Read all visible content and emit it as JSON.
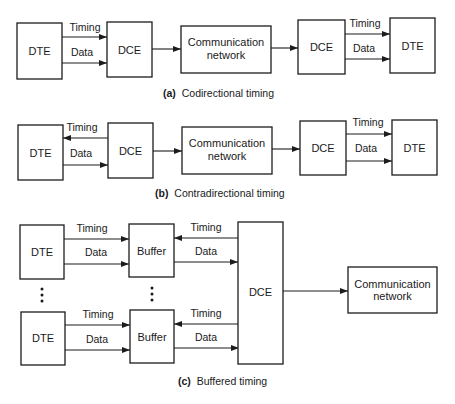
{
  "diagram": {
    "sections": [
      {
        "id": "a",
        "caption_prefix": "(a)",
        "caption_text": "Codirectional timing",
        "nodes": {
          "dte_left": "DTE",
          "dce_left": "DCE",
          "network_line1": "Communication",
          "network_line2": "network",
          "dce_right": "DCE",
          "dte_right": "DTE"
        },
        "signals": {
          "left_timing": "Timing",
          "left_data": "Data",
          "right_timing": "Timing",
          "right_data": "Data"
        },
        "flows": [
          {
            "from": "DTE",
            "to": "DCE",
            "signal": "Timing"
          },
          {
            "from": "DTE",
            "to": "DCE",
            "signal": "Data"
          },
          {
            "from": "DCE",
            "to": "Communication network"
          },
          {
            "from": "Communication network",
            "to": "DCE"
          },
          {
            "from": "DCE",
            "to": "DTE",
            "signal": "Timing"
          },
          {
            "from": "DCE",
            "to": "DTE",
            "signal": "Data"
          }
        ]
      },
      {
        "id": "b",
        "caption_prefix": "(b)",
        "caption_text": "Contradirectional timing",
        "nodes": {
          "dte_left": "DTE",
          "dce_left": "DCE",
          "network_line1": "Communication",
          "network_line2": "network",
          "dce_right": "DCE",
          "dte_right": "DTE"
        },
        "signals": {
          "left_timing": "Timing",
          "left_data": "Data",
          "right_timing": "Timing",
          "right_data": "Data"
        },
        "flows": [
          {
            "from": "DCE",
            "to": "DTE",
            "signal": "Timing"
          },
          {
            "from": "DTE",
            "to": "DCE",
            "signal": "Data"
          },
          {
            "from": "DCE",
            "to": "Communication network"
          },
          {
            "from": "Communication network",
            "to": "DCE"
          },
          {
            "from": "DCE",
            "to": "DTE",
            "signal": "Timing"
          },
          {
            "from": "DCE",
            "to": "DTE",
            "signal": "Data"
          }
        ]
      },
      {
        "id": "c",
        "caption_prefix": "(c)",
        "caption_text": "Buffered timing",
        "nodes": {
          "dte_top": "DTE",
          "buffer_top": "Buffer",
          "dte_bottom": "DTE",
          "buffer_bottom": "Buffer",
          "dce": "DCE",
          "network_line1": "Communication",
          "network_line2": "network"
        },
        "signals": {
          "top_left_timing": "Timing",
          "top_left_data": "Data",
          "top_right_timing": "Timing",
          "top_right_data": "Data",
          "bottom_left_timing": "Timing",
          "bottom_left_data": "Data",
          "bottom_right_timing": "Timing",
          "bottom_right_data": "Data"
        },
        "flows": [
          {
            "from": "DTE",
            "to": "Buffer",
            "signal": "Timing"
          },
          {
            "from": "DTE",
            "to": "Buffer",
            "signal": "Data"
          },
          {
            "from": "DCE",
            "to": "Buffer",
            "signal": "Timing"
          },
          {
            "from": "Buffer",
            "to": "DCE",
            "signal": "Data"
          },
          {
            "from": "DCE",
            "to": "Communication network"
          }
        ]
      }
    ]
  }
}
